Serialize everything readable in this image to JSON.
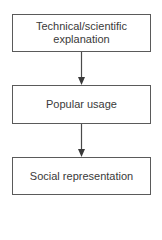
{
  "diagram": {
    "type": "flowchart",
    "direction": "top-to-bottom",
    "nodes": [
      {
        "id": "n1",
        "label": "Technical/scientific explanation",
        "lines": [
          "Technical/scientific",
          "explanation"
        ]
      },
      {
        "id": "n2",
        "label": "Popular usage"
      },
      {
        "id": "n3",
        "label": "Social representation"
      }
    ],
    "edges": [
      {
        "from": "n1",
        "to": "n2"
      },
      {
        "from": "n2",
        "to": "n3"
      }
    ],
    "colors": {
      "line": "#4a4a4a",
      "text": "#3a3a3a",
      "background": "#ffffff"
    }
  }
}
